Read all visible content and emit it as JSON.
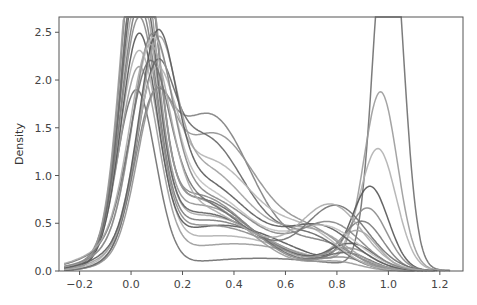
{
  "chart_data": {
    "type": "line",
    "title": "",
    "xlabel": "",
    "ylabel": "Density",
    "xlim": [
      -0.28,
      1.29
    ],
    "ylim": [
      0.0,
      2.66
    ],
    "xticks": [
      -0.2,
      0.0,
      0.2,
      0.4,
      0.6,
      0.8,
      1.0,
      1.2
    ],
    "xtick_labels": [
      "−0.2",
      "0.0",
      "0.2",
      "0.4",
      "0.6",
      "0.8",
      "1.0",
      "1.2"
    ],
    "yticks": [
      0.0,
      0.5,
      1.0,
      1.5,
      2.0,
      2.5
    ],
    "ytick_labels": [
      "0.0",
      "0.5",
      "1.0",
      "1.5",
      "2.0",
      "2.5"
    ],
    "grid": false,
    "legend": "none",
    "series": [
      {
        "name": "s1",
        "color": "#6e6e6e",
        "components": [
          [
            0.35,
            0.02,
            0.075
          ],
          [
            0.1,
            0.5,
            0.3
          ],
          [
            0.55,
            1.0,
            0.055
          ]
        ],
        "approx_peaks": {
          "x0": 0.55,
          "x1": 2.17
        }
      },
      {
        "name": "s2",
        "color": "#9a9a9a",
        "components": [
          [
            0.38,
            0.03,
            0.075
          ],
          [
            0.2,
            0.4,
            0.28
          ],
          [
            0.3,
            0.97,
            0.065
          ]
        ],
        "approx_peaks": {
          "x0": 1.6,
          "x1": 1.28
        }
      },
      {
        "name": "s3",
        "color": "#b0b0b0",
        "components": [
          [
            0.4,
            0.03,
            0.075
          ],
          [
            0.25,
            0.35,
            0.27
          ],
          [
            0.22,
            0.96,
            0.07
          ]
        ],
        "approx_peaks": {
          "x0": 1.75,
          "x1": 0.92
        }
      },
      {
        "name": "s4",
        "color": "#555555",
        "components": [
          [
            0.4,
            0.03,
            0.07
          ],
          [
            0.3,
            0.35,
            0.25
          ],
          [
            0.15,
            0.93,
            0.07
          ]
        ],
        "approx_peaks": {
          "x0": 1.8,
          "x1": 0.72
        }
      },
      {
        "name": "s5",
        "color": "#8a8a8a",
        "components": [
          [
            0.42,
            0.03,
            0.07
          ],
          [
            0.3,
            0.3,
            0.25
          ],
          [
            0.12,
            0.92,
            0.075
          ]
        ],
        "approx_peaks": {
          "x0": 1.85,
          "x1": 0.62
        }
      },
      {
        "name": "s6",
        "color": "#7a7a7a",
        "components": [
          [
            0.44,
            0.03,
            0.07
          ],
          [
            0.32,
            0.3,
            0.24
          ],
          [
            0.1,
            0.9,
            0.08
          ]
        ],
        "approx_peaks": {
          "x0": 1.9,
          "x1": 0.55
        }
      },
      {
        "name": "s7",
        "color": "#a5a5a5",
        "components": [
          [
            0.46,
            0.03,
            0.07
          ],
          [
            0.35,
            0.28,
            0.24
          ],
          [
            0.08,
            0.88,
            0.08
          ]
        ],
        "approx_peaks": {
          "x0": 2.0,
          "x1": 0.45
        }
      },
      {
        "name": "s8",
        "color": "#5e5e5e",
        "components": [
          [
            0.48,
            0.03,
            0.068
          ],
          [
            0.35,
            0.27,
            0.23
          ],
          [
            0.06,
            0.86,
            0.09
          ]
        ],
        "approx_peaks": {
          "x0": 2.1,
          "x1": 0.38
        }
      },
      {
        "name": "s9",
        "color": "#959595",
        "components": [
          [
            0.5,
            0.03,
            0.066
          ],
          [
            0.38,
            0.26,
            0.22
          ],
          [
            0.05,
            0.85,
            0.09
          ]
        ],
        "approx_peaks": {
          "x0": 2.2,
          "x1": 0.33
        }
      },
      {
        "name": "s10",
        "color": "#6a6a6a",
        "components": [
          [
            0.52,
            0.035,
            0.066
          ],
          [
            0.4,
            0.25,
            0.21
          ],
          [
            0.04,
            0.84,
            0.09
          ]
        ],
        "approx_peaks": {
          "x0": 2.3,
          "x1": 0.3
        }
      },
      {
        "name": "s11",
        "color": "#888888",
        "components": [
          [
            0.55,
            0.03,
            0.066
          ],
          [
            0.4,
            0.25,
            0.2
          ],
          [
            0.03,
            0.82,
            0.09
          ]
        ],
        "approx_peaks": {
          "x0": 2.4,
          "x1": 0.25
        }
      },
      {
        "name": "s12",
        "color": "#999999",
        "components": [
          [
            0.58,
            0.03,
            0.066
          ],
          [
            0.38,
            0.24,
            0.2
          ],
          [
            0.02,
            0.8,
            0.09
          ]
        ],
        "approx_peaks": {
          "x0": 2.55,
          "x1": 0.2
        }
      },
      {
        "name": "s13",
        "color": "#7e7e7e",
        "components": [
          [
            0.2,
            0.08,
            0.07
          ],
          [
            0.7,
            0.3,
            0.17
          ],
          [
            0.08,
            0.75,
            0.12
          ]
        ],
        "approx_peaks": {
          "mid": 2.1
        }
      },
      {
        "name": "s14",
        "color": "#909090",
        "components": [
          [
            0.22,
            0.09,
            0.07
          ],
          [
            0.65,
            0.32,
            0.18
          ],
          [
            0.1,
            0.72,
            0.12
          ]
        ],
        "approx_peaks": {
          "mid": 1.95
        }
      },
      {
        "name": "s15",
        "color": "#666666",
        "components": [
          [
            0.25,
            0.09,
            0.07
          ],
          [
            0.6,
            0.28,
            0.17
          ],
          [
            0.1,
            0.7,
            0.12
          ]
        ],
        "approx_peaks": {
          "mid": 1.9
        }
      },
      {
        "name": "s16",
        "color": "#b5b5b5",
        "components": [
          [
            0.28,
            0.09,
            0.075
          ],
          [
            0.55,
            0.3,
            0.19
          ],
          [
            0.1,
            0.7,
            0.12
          ]
        ],
        "approx_peaks": {
          "mid": 1.8
        }
      },
      {
        "name": "s17",
        "color": "#a0a0a0",
        "components": [
          [
            0.3,
            0.1,
            0.07
          ],
          [
            0.52,
            0.27,
            0.19
          ],
          [
            0.12,
            0.72,
            0.13
          ]
        ],
        "approx_peaks": {
          "mid": 1.75
        }
      },
      {
        "name": "s18",
        "color": "#5a5a5a",
        "components": [
          [
            0.32,
            0.1,
            0.07
          ],
          [
            0.48,
            0.26,
            0.2
          ],
          [
            0.14,
            0.74,
            0.13
          ]
        ],
        "approx_peaks": {
          "mid": 1.7
        }
      },
      {
        "name": "s19",
        "color": "#c0c0c0",
        "components": [
          [
            0.34,
            0.08,
            0.075
          ],
          [
            0.46,
            0.25,
            0.21
          ],
          [
            0.14,
            0.76,
            0.13
          ]
        ],
        "approx_peaks": {
          "mid": 1.7
        }
      },
      {
        "name": "s20",
        "color": "#858585",
        "components": [
          [
            0.36,
            0.08,
            0.075
          ],
          [
            0.44,
            0.26,
            0.22
          ],
          [
            0.14,
            0.78,
            0.12
          ]
        ],
        "approx_peaks": {
          "mid": 1.65
        }
      },
      {
        "name": "s21",
        "color": "#707070",
        "components": [
          [
            0.3,
            0.07,
            0.075
          ],
          [
            0.42,
            0.22,
            0.22
          ],
          [
            0.2,
            0.8,
            0.12
          ]
        ],
        "approx_peaks": {
          "mid": 1.6
        }
      },
      {
        "name": "s22",
        "color": "#aaaaaa",
        "components": [
          [
            0.34,
            0.07,
            0.075
          ],
          [
            0.4,
            0.22,
            0.23
          ],
          [
            0.2,
            0.78,
            0.12
          ]
        ],
        "approx_peaks": {
          "mid": 1.55
        }
      }
    ]
  },
  "axes": {
    "ylabel": "Density"
  },
  "plot_area": {
    "left": 59,
    "top": 17,
    "right": 463,
    "bottom": 271
  }
}
